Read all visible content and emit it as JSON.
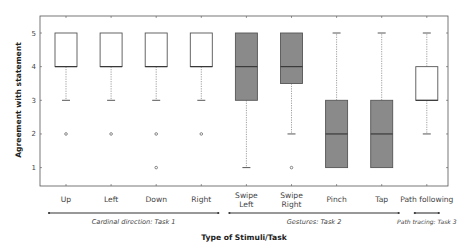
{
  "chart_data": {
    "type": "box",
    "title": "",
    "xlabel": "Type of Stimuli/Task",
    "ylabel": "Agreement with statement",
    "ylim": [
      0.5,
      5.5
    ],
    "yticks": [
      1,
      2,
      3,
      4,
      5
    ],
    "grid": false,
    "categories": [
      "Up",
      "Left",
      "Down",
      "Right",
      "Swipe Left",
      "Swipe Right",
      "Pinch",
      "Tap",
      "Path following"
    ],
    "category_lines": [
      [
        "Up"
      ],
      [
        "Left"
      ],
      [
        "Down"
      ],
      [
        "Right"
      ],
      [
        "Swipe",
        "Left"
      ],
      [
        "Swipe",
        "Right"
      ],
      [
        "Pinch"
      ],
      [
        "Tap"
      ],
      [
        "Path following"
      ]
    ],
    "boxes": [
      {
        "name": "Up",
        "whisker_low": 3,
        "q1": 4,
        "median": 4,
        "q3": 5,
        "whisker_high": 5,
        "outliers": [
          2
        ],
        "fill": "#ffffff"
      },
      {
        "name": "Left",
        "whisker_low": 3,
        "q1": 4,
        "median": 4,
        "q3": 5,
        "whisker_high": 5,
        "outliers": [
          2
        ],
        "fill": "#ffffff"
      },
      {
        "name": "Down",
        "whisker_low": 3,
        "q1": 4,
        "median": 4,
        "q3": 5,
        "whisker_high": 5,
        "outliers": [
          2,
          1
        ],
        "fill": "#ffffff"
      },
      {
        "name": "Right",
        "whisker_low": 3,
        "q1": 4,
        "median": 4,
        "q3": 5,
        "whisker_high": 5,
        "outliers": [
          2
        ],
        "fill": "#ffffff"
      },
      {
        "name": "Swipe Left",
        "whisker_low": 1,
        "q1": 3,
        "median": 4,
        "q3": 5,
        "whisker_high": 5,
        "outliers": [],
        "fill": "#8a8a8a"
      },
      {
        "name": "Swipe Right",
        "whisker_low": 2,
        "q1": 3.5,
        "median": 4,
        "q3": 5,
        "whisker_high": 5,
        "outliers": [
          1
        ],
        "fill": "#8a8a8a"
      },
      {
        "name": "Pinch",
        "whisker_low": 1,
        "q1": 1,
        "median": 2,
        "q3": 3,
        "whisker_high": 5,
        "outliers": [],
        "fill": "#8a8a8a"
      },
      {
        "name": "Tap",
        "whisker_low": 1,
        "q1": 1,
        "median": 2,
        "q3": 3,
        "whisker_high": 5,
        "outliers": [],
        "fill": "#8a8a8a"
      },
      {
        "name": "Path following",
        "whisker_low": 2,
        "q1": 3,
        "median": 3,
        "q3": 4,
        "whisker_high": 5,
        "outliers": [],
        "fill": "#ffffff"
      }
    ],
    "groups": [
      {
        "label": "Cardinal direction: Task 1",
        "from": 0,
        "to": 3
      },
      {
        "label": "Gestures: Task 2",
        "from": 4,
        "to": 7
      },
      {
        "label": "Path tracing: Task 3",
        "from": 8,
        "to": 8
      }
    ]
  }
}
